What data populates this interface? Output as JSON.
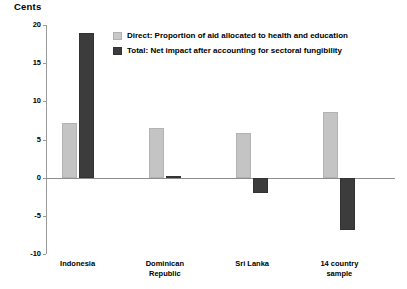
{
  "chart_data": {
    "type": "bar",
    "title": "Cents",
    "xlabel": "",
    "ylabel": "Cents",
    "ylim": [
      -10,
      20
    ],
    "yticks": [
      20,
      15,
      10,
      5,
      0,
      -5,
      -10
    ],
    "ytick_labels": [
      "20",
      "15",
      "10",
      "5",
      "0",
      "-5",
      "-10"
    ],
    "grid": false,
    "legend_position": "upper-center",
    "categories": [
      "Indonesia",
      "Dominican\nRepublic",
      "Sri Lanka",
      "14 country\nsample"
    ],
    "series": [
      {
        "name": "Direct: Proportion of aid allocated to health and education",
        "color": "#c4c4c4",
        "values": [
          7.1,
          6.5,
          5.8,
          8.6
        ]
      },
      {
        "name": "Total: Net impact after accounting for sectoral fungibility",
        "color": "#3c3c3c",
        "values": [
          19.0,
          0.2,
          -2.0,
          -6.8
        ]
      }
    ]
  },
  "legend": {
    "items": [
      {
        "label": "Direct: Proportion of aid allocated to health and education"
      },
      {
        "label": "Total: Net impact after accounting for sectoral fungibility"
      }
    ]
  }
}
